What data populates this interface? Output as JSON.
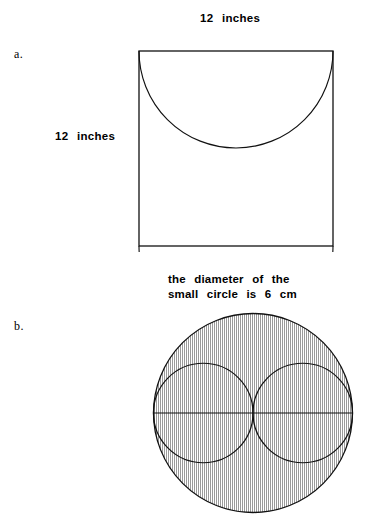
{
  "page": {
    "background_color": "#ffffff",
    "ink_color": "#111111",
    "width": 369,
    "height": 531
  },
  "problems": [
    {
      "letter": "a.",
      "top_label": "12  inches",
      "left_label": "12  inches",
      "figure": {
        "type": "square-with-two-semicircles",
        "square_side_label": "12 inches",
        "semicircles": 2
      }
    },
    {
      "letter": "b.",
      "caption_line1": "the  diameter  of  the",
      "caption_line2": "small  circle  is  6  cm",
      "figure": {
        "type": "large-circle-with-two-inscribed-circles",
        "small_circle_diameter": "6 cm",
        "small_circles": 2,
        "shaded": true,
        "shading_style": "vertical-hatch",
        "shading_color": "#9a9a9a",
        "has_diameter_line": true
      }
    }
  ]
}
